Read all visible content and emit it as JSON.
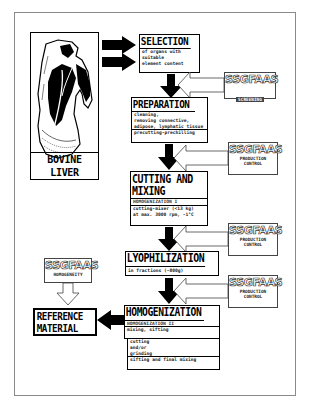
{
  "diagram": {
    "source": {
      "label": "BOVINE LIVER",
      "image": "bovine-liver-illustration"
    },
    "steps": [
      {
        "id": "selection",
        "title": "SELECTION",
        "details": [
          "of organs with",
          "suitable",
          "element content"
        ]
      },
      {
        "id": "preparation",
        "title": "PREPARATION",
        "details": [
          "cleaning,",
          "removing connective,",
          "adipose, lymphatic tissue"
        ],
        "footer": "precutting-prechilling"
      },
      {
        "id": "cutting-mixing",
        "title_lines": [
          "CUTTING AND",
          "MIXING"
        ],
        "header": "HOMOGENIZATION I",
        "details": [
          "cutting-mixer (<13 kg)",
          "at max. 3000 rpm, -1°C"
        ]
      },
      {
        "id": "lyophilization",
        "title": "LYOPHILIZATION",
        "details": [
          "in fractions (~800g)"
        ]
      },
      {
        "id": "homogenization",
        "title": "HOMOGENIZATION",
        "header": "HOMOGENIZATION II",
        "line2": "mixing, sifting",
        "details": [
          "cutting",
          "and/or",
          "grinding"
        ],
        "footer": "sifting and final mixing"
      }
    ],
    "result": {
      "title_lines": [
        "REFERENCE",
        "MATERIAL"
      ]
    },
    "controls": [
      {
        "name": "SSGFAAS",
        "role": "SCREENING",
        "target": "selection-preparation"
      },
      {
        "name": "SSGFAAS",
        "role_lines": [
          "PRODUCTION",
          "CONTROL"
        ],
        "target": "preparation-cutting"
      },
      {
        "name": "SSGFAAS",
        "role_lines": [
          "PRODUCTION",
          "CONTROL"
        ],
        "target": "cutting-lyophilization"
      },
      {
        "name": "SSGFAAS",
        "role_lines": [
          "PRODUCTION",
          "CONTROL"
        ],
        "target": "lyophilization-homogenization"
      },
      {
        "name": "SSGFAAS",
        "role": "HOMOGENEITY",
        "target": "reference-material"
      }
    ],
    "colors": {
      "ink": "#000000",
      "frame": "#8a8a8a",
      "background": "#ffffff"
    }
  }
}
